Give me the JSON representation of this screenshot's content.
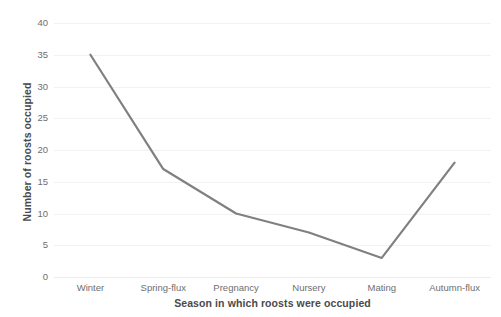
{
  "chart_data": {
    "type": "line",
    "title": "",
    "subtitle": "",
    "xlabel": "Season in which roosts were occupied",
    "ylabel": "Number of roosts occupied",
    "categories": [
      "Winter",
      "Spring-flux",
      "Pregnancy",
      "Nursery",
      "Mating",
      "Autumn-flux"
    ],
    "values": [
      35,
      17,
      10,
      7,
      3,
      18
    ],
    "series": [
      {
        "name": "Number of roosts occupied",
        "values": [
          35,
          17,
          10,
          7,
          3,
          18
        ]
      }
    ],
    "ylim": [
      0,
      40
    ],
    "ytick_step": 5,
    "ytick_labels": [
      "0",
      "5",
      "10",
      "15",
      "20",
      "25",
      "30",
      "35",
      "40"
    ],
    "ytick_values": [
      0,
      5,
      10,
      15,
      20,
      25,
      30,
      35,
      40
    ],
    "grid": true,
    "grid_axis": "y",
    "legend": false,
    "legend_position": "none",
    "markers": false,
    "line_color": "#808080",
    "line_width": 2.2,
    "grid_color": "#f2f2f2",
    "background_color": "#ffffff",
    "text_color": "#6e6e6e",
    "axis_title_color": "#4a4a4a"
  }
}
